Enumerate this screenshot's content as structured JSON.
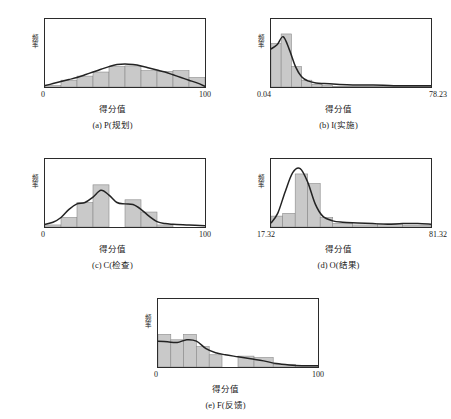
{
  "figure": {
    "background": "#ffffff",
    "bar_fill": "#c9c9c9",
    "bar_stroke": "#8a8a8a",
    "curve_color": "#232323",
    "axis_color": "#2b2b2b",
    "y_axis_label": "频率",
    "x_axis_label": "得分值"
  },
  "panels": [
    {
      "key": "a",
      "caption": "(a) P(规划)",
      "x_label": "得分值",
      "y_label": "频率",
      "x_tick_min": "0",
      "x_tick_max": "100"
    },
    {
      "key": "b",
      "caption": "(b) I(实施)",
      "x_label": "得分值",
      "y_label": "频率",
      "x_tick_min": "0.04",
      "x_tick_max": "78.23"
    },
    {
      "key": "c",
      "caption": "(c) C(检查)",
      "x_label": "得分值",
      "y_label": "频率",
      "x_tick_min": "0",
      "x_tick_max": "100"
    },
    {
      "key": "d",
      "caption": "(d) O(结果)",
      "x_label": "得分值",
      "y_label": "频率",
      "x_tick_min": "17.32",
      "x_tick_max": "81.32"
    },
    {
      "key": "e",
      "caption": "(e) F(反馈)",
      "x_label": "得分值",
      "y_label": "频率",
      "x_tick_min": "0",
      "x_tick_max": "100"
    }
  ],
  "chart_data": [
    {
      "type": "bar",
      "id": "a",
      "title": "(a) P(规划)",
      "xlabel": "得分值",
      "ylabel": "频率",
      "xlim": [
        0,
        100
      ],
      "ylim": [
        0,
        1.0
      ],
      "grid": false,
      "legend": "none",
      "bin_edges": [
        0,
        10,
        20,
        30,
        40,
        50,
        60,
        70,
        80,
        90,
        100
      ],
      "values": [
        0.02,
        0.1,
        0.16,
        0.22,
        0.3,
        0.31,
        0.24,
        0.23,
        0.24,
        0.14
      ],
      "curve": {
        "name": "核密度曲线",
        "x": [
          0,
          5,
          10,
          15,
          20,
          25,
          30,
          35,
          40,
          45,
          50,
          55,
          60,
          65,
          70,
          75,
          80,
          85,
          90,
          95,
          100
        ],
        "y": [
          0.02,
          0.05,
          0.08,
          0.11,
          0.14,
          0.18,
          0.22,
          0.26,
          0.3,
          0.33,
          0.34,
          0.33,
          0.31,
          0.28,
          0.25,
          0.22,
          0.18,
          0.14,
          0.1,
          0.06,
          0.01
        ]
      }
    },
    {
      "type": "bar",
      "id": "b",
      "title": "(b) I(实施)",
      "xlabel": "得分值",
      "ylabel": "频率",
      "xlim": [
        0.04,
        78.23
      ],
      "ylim": [
        0,
        1.0
      ],
      "grid": false,
      "legend": "none",
      "bin_edges": [
        0.04,
        5,
        10,
        15,
        20,
        25,
        30,
        78.23
      ],
      "values": [
        0.64,
        0.78,
        0.3,
        0.1,
        0.04,
        0.02,
        0.01
      ],
      "curve": {
        "name": "核密度曲线",
        "x": [
          0.04,
          3,
          6,
          9,
          12,
          15,
          18,
          22,
          26,
          32,
          40,
          50,
          60,
          70,
          78.23
        ],
        "y": [
          0.56,
          0.62,
          0.74,
          0.55,
          0.3,
          0.15,
          0.09,
          0.06,
          0.05,
          0.04,
          0.03,
          0.03,
          0.02,
          0.02,
          0.02
        ]
      }
    },
    {
      "type": "bar",
      "id": "c",
      "title": "(c) C(检查)",
      "xlabel": "得分值",
      "ylabel": "频率",
      "xlim": [
        0,
        100
      ],
      "ylim": [
        0,
        1.0
      ],
      "grid": false,
      "legend": "none",
      "bin_edges": [
        0,
        10,
        20,
        30,
        40,
        50,
        60,
        70,
        80,
        90,
        100
      ],
      "values": [
        0.03,
        0.14,
        0.36,
        0.62,
        0.0,
        0.4,
        0.22,
        0.03,
        0.0,
        0.0
      ],
      "curve": {
        "name": "核密度曲线",
        "x": [
          0,
          5,
          10,
          15,
          20,
          25,
          30,
          35,
          40,
          45,
          50,
          55,
          60,
          65,
          70,
          75,
          80,
          90,
          100
        ],
        "y": [
          0.04,
          0.07,
          0.14,
          0.26,
          0.34,
          0.36,
          0.44,
          0.54,
          0.47,
          0.36,
          0.34,
          0.33,
          0.26,
          0.16,
          0.08,
          0.05,
          0.04,
          0.03,
          0.02
        ]
      }
    },
    {
      "type": "bar",
      "id": "d",
      "title": "(d) O(结果)",
      "xlabel": "得分值",
      "ylabel": "频率",
      "xlim": [
        17.32,
        81.32
      ],
      "ylim": [
        0,
        1.0
      ],
      "grid": false,
      "legend": "none",
      "bin_edges": [
        17.32,
        22,
        27,
        32,
        37,
        42,
        50,
        60,
        70,
        81.32
      ],
      "values": [
        0.16,
        0.2,
        0.78,
        0.64,
        0.14,
        0.05,
        0.03,
        0.05,
        0.02
      ],
      "curve": {
        "name": "核密度曲线",
        "x": [
          17.32,
          20,
          23,
          26,
          29,
          32,
          35,
          38,
          42,
          46,
          52,
          58,
          64,
          70,
          76,
          81.32
        ],
        "y": [
          0.06,
          0.2,
          0.52,
          0.8,
          0.86,
          0.66,
          0.34,
          0.16,
          0.09,
          0.07,
          0.06,
          0.05,
          0.04,
          0.05,
          0.05,
          0.04
        ]
      }
    },
    {
      "type": "bar",
      "id": "e",
      "title": "(e) F(反馈)",
      "xlabel": "得分值",
      "ylabel": "频率",
      "xlim": [
        0,
        100
      ],
      "ylim": [
        0,
        1.0
      ],
      "grid": false,
      "legend": "none",
      "bin_edges": [
        0,
        8,
        16,
        24,
        32,
        40,
        50,
        60,
        72,
        86,
        100
      ],
      "values": [
        0.48,
        0.4,
        0.48,
        0.3,
        0.18,
        0.0,
        0.16,
        0.14,
        0.04,
        0.02
      ],
      "curve": {
        "name": "核密度曲线",
        "x": [
          0,
          6,
          12,
          18,
          24,
          30,
          36,
          42,
          50,
          58,
          66,
          74,
          82,
          90,
          100
        ],
        "y": [
          0.38,
          0.37,
          0.36,
          0.4,
          0.38,
          0.27,
          0.21,
          0.18,
          0.15,
          0.12,
          0.09,
          0.05,
          0.03,
          0.02,
          0.02
        ]
      }
    }
  ]
}
